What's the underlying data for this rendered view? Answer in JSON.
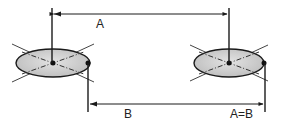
{
  "diagram": {
    "labels": {
      "a": "A",
      "b": "B",
      "equality": "A=B"
    },
    "colors": {
      "stroke": "#1a1a1a",
      "disc_fill": "#c9c9c9",
      "background": "#ffffff"
    },
    "elements": {
      "left_disc": {
        "cx": 53,
        "cy": 63,
        "rx": 37,
        "ry": 14
      },
      "right_disc": {
        "cx": 229,
        "cy": 63,
        "rx": 35,
        "ry": 14
      },
      "dimension_a": {
        "x1": 52,
        "x2": 229,
        "y": 14
      },
      "dimension_b": {
        "x1": 88,
        "x2": 265,
        "y": 104
      }
    }
  }
}
